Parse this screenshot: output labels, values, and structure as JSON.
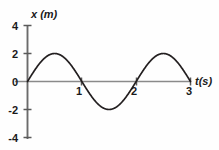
{
  "chart_data": {
    "type": "line",
    "title": "",
    "subtitle": "",
    "xlabel": "t(s)",
    "ylabel": "x (m)",
    "xlim": [
      0,
      3
    ],
    "ylim": [
      -4,
      4
    ],
    "grid": false,
    "legend": null,
    "x_ticks": [
      "1",
      "2",
      "3"
    ],
    "x_tick_values": [
      1,
      2,
      3
    ],
    "y_ticks": [
      "4",
      "2",
      "0",
      "-2",
      "-4"
    ],
    "y_tick_values": [
      4,
      2,
      0,
      -2,
      -4
    ],
    "series": [
      {
        "name": "x(t)",
        "equation": "x = 2 sin(pi t)",
        "amplitude": 2,
        "period": 2,
        "color": "#231f20",
        "x": [
          0,
          0.1,
          0.2,
          0.3,
          0.4,
          0.5,
          0.6,
          0.7,
          0.8,
          0.9,
          1.0,
          1.1,
          1.2,
          1.3,
          1.4,
          1.5,
          1.6,
          1.7,
          1.8,
          1.9,
          2.0,
          2.1,
          2.2,
          2.3,
          2.4,
          2.5,
          2.6,
          2.7,
          2.8,
          2.9,
          3.0
        ],
        "values": [
          0,
          0.62,
          1.18,
          1.62,
          1.9,
          2.0,
          1.9,
          1.62,
          1.18,
          0.62,
          0,
          -0.62,
          -1.18,
          -1.62,
          -1.9,
          -2.0,
          -1.9,
          -1.62,
          -1.18,
          -0.62,
          0,
          0.62,
          1.18,
          1.62,
          1.9,
          2.0,
          1.9,
          1.62,
          1.18,
          0.62,
          0
        ]
      }
    ],
    "annotations": [],
    "axis_color": "#8a8a8a",
    "curve_color": "#231f20",
    "background_color": "#fefefe"
  },
  "labels": {
    "y_axis_var": "x",
    "y_axis_unit": "(m)",
    "y_axis_full": "x (m)",
    "x_axis_var": "t",
    "x_axis_unit": "(s)",
    "x_axis_full": "t(s)",
    "y_tick_4": "4",
    "y_tick_2": "2",
    "y_tick_0": "0",
    "y_tick_neg2": "-2",
    "y_tick_neg4": "-4",
    "x_tick_1": "1",
    "x_tick_2": "2",
    "x_tick_3": "3"
  }
}
